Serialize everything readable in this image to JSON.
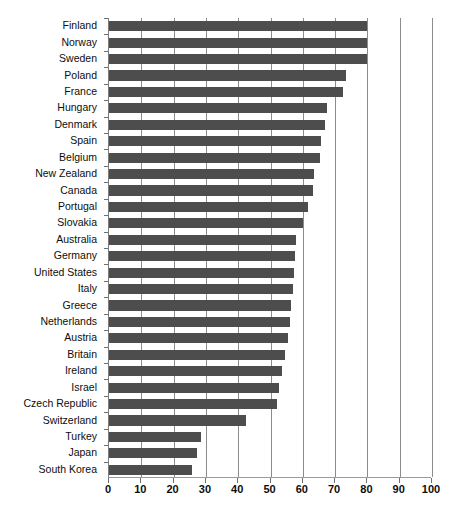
{
  "chart_data": {
    "type": "bar",
    "orientation": "horizontal",
    "title": "",
    "subtitle": "",
    "xlabel": "",
    "ylabel": "",
    "xlim": [
      0,
      100
    ],
    "xticks": [
      0,
      10,
      20,
      30,
      40,
      50,
      60,
      70,
      80,
      90,
      100
    ],
    "xtick_labels": [
      "0",
      "10",
      "20",
      "30",
      "40",
      "50",
      "60",
      "70",
      "80",
      "90",
      "100"
    ],
    "grid": "vertical",
    "legend": "none",
    "bar_color": "#4d4d4d",
    "background_color": "#ffffff",
    "gridline_color": "#8c8c8c",
    "categories": [
      "Finland",
      "Norway",
      "Sweden",
      "Poland",
      "France",
      "Hungary",
      "Denmark",
      "Spain",
      "Belgium",
      "New Zealand",
      "Canada",
      "Portugal",
      "Slovakia",
      "Australia",
      "Germany",
      "United States",
      "Italy",
      "Greece",
      "Netherlands",
      "Austria",
      "Britain",
      "Ireland",
      "Israel",
      "Czech Republic",
      "Switzerland",
      "Turkey",
      "Japan",
      "South Korea"
    ],
    "values": [
      80,
      80,
      80,
      73.5,
      72.5,
      67.5,
      67,
      65.5,
      65.3,
      63.5,
      63.3,
      61.5,
      60,
      58,
      57.6,
      57.3,
      57,
      56.3,
      56,
      55.4,
      54.5,
      53.5,
      52.6,
      51.9,
      42.4,
      28.5,
      27.2,
      25.7
    ]
  },
  "artifact": {
    "bottom_text": ""
  }
}
